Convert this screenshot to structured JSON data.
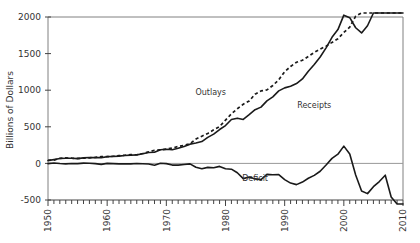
{
  "chart_data": {
    "type": "line",
    "title": "",
    "xlabel": "",
    "ylabel": "Billions of Dollars",
    "xlim": [
      1950,
      2010
    ],
    "ylim": [
      -500,
      2000
    ],
    "yticks": [
      -500,
      0,
      500,
      1000,
      1500,
      2000
    ],
    "ytick_labels": [
      "-500",
      "0",
      "500",
      "1000",
      "1500",
      "2000"
    ],
    "xticks": [
      1950,
      1960,
      1970,
      1980,
      1990,
      2000,
      2010
    ],
    "xtick_labels": [
      "1950",
      "1960",
      "1970",
      "1980",
      "1990",
      "2000",
      "2010"
    ],
    "minor_xtick_interval": 1,
    "grid": false,
    "legend": "inline-annotations",
    "zero_reference_line": true,
    "annotations": [
      {
        "text": "Outlays",
        "x": 1977.5,
        "y": 930,
        "series": "Outlays"
      },
      {
        "text": "Receipts",
        "x": 1995.0,
        "y": 760,
        "series": "Receipts"
      },
      {
        "text": "Deficit",
        "x": 1985.0,
        "y": -240,
        "series": "Deficit"
      }
    ],
    "x": [
      1950,
      1951,
      1952,
      1953,
      1954,
      1955,
      1956,
      1957,
      1958,
      1959,
      1960,
      1961,
      1962,
      1963,
      1964,
      1965,
      1966,
      1967,
      1968,
      1969,
      1970,
      1971,
      1972,
      1973,
      1974,
      1975,
      1976,
      1977,
      1978,
      1979,
      1980,
      1981,
      1982,
      1983,
      1984,
      1985,
      1986,
      1987,
      1988,
      1989,
      1990,
      1991,
      1992,
      1993,
      1994,
      1995,
      1996,
      1997,
      1998,
      1999,
      2000,
      2001,
      2002,
      2003,
      2004,
      2005,
      2006,
      2007,
      2008,
      2009,
      2010
    ],
    "series": [
      {
        "name": "Outlays",
        "style": "dashed",
        "values": [
          42,
          45,
          68,
          76,
          71,
          68,
          71,
          76,
          82,
          92,
          92,
          98,
          107,
          111,
          119,
          118,
          135,
          157,
          178,
          184,
          196,
          210,
          231,
          246,
          269,
          332,
          372,
          409,
          459,
          504,
          591,
          678,
          746,
          808,
          852,
          946,
          990,
          1004,
          1064,
          1143,
          1253,
          1324,
          1382,
          1409,
          1462,
          1516,
          1561,
          1601,
          1653,
          1702,
          1789,
          1863,
          2011,
          2160,
          2293,
          2472,
          2655,
          2729,
          2983,
          3518,
          3456
        ]
      },
      {
        "name": "Receipts",
        "style": "solid",
        "values": [
          39,
          52,
          66,
          70,
          70,
          65,
          75,
          80,
          79,
          79,
          92,
          94,
          100,
          107,
          113,
          117,
          131,
          149,
          153,
          187,
          193,
          187,
          207,
          231,
          263,
          279,
          298,
          356,
          400,
          463,
          517,
          599,
          618,
          601,
          666,
          734,
          769,
          854,
          909,
          991,
          1032,
          1055,
          1091,
          1154,
          1259,
          1352,
          1453,
          1579,
          1722,
          1828,
          2025,
          1991,
          1853,
          1782,
          1880,
          2154,
          2407,
          2568,
          2524,
          2105,
          2163
        ]
      },
      {
        "name": "Deficit",
        "style": "solid",
        "values": [
          -3,
          6,
          -2,
          -6,
          -1,
          -3,
          4,
          3,
          -3,
          -13,
          0,
          -3,
          -7,
          -5,
          -6,
          -1,
          -4,
          -9,
          -25,
          3,
          -3,
          -23,
          -23,
          -15,
          -6,
          -53,
          -74,
          -54,
          -59,
          -41,
          -74,
          -79,
          -128,
          -208,
          -185,
          -212,
          -221,
          -150,
          -155,
          -152,
          -221,
          -269,
          -290,
          -255,
          -203,
          -164,
          -107,
          -22,
          69,
          126,
          236,
          128,
          -158,
          -378,
          -413,
          -318,
          -248,
          -161,
          -459,
          -1413,
          -1293
        ]
      }
    ]
  }
}
